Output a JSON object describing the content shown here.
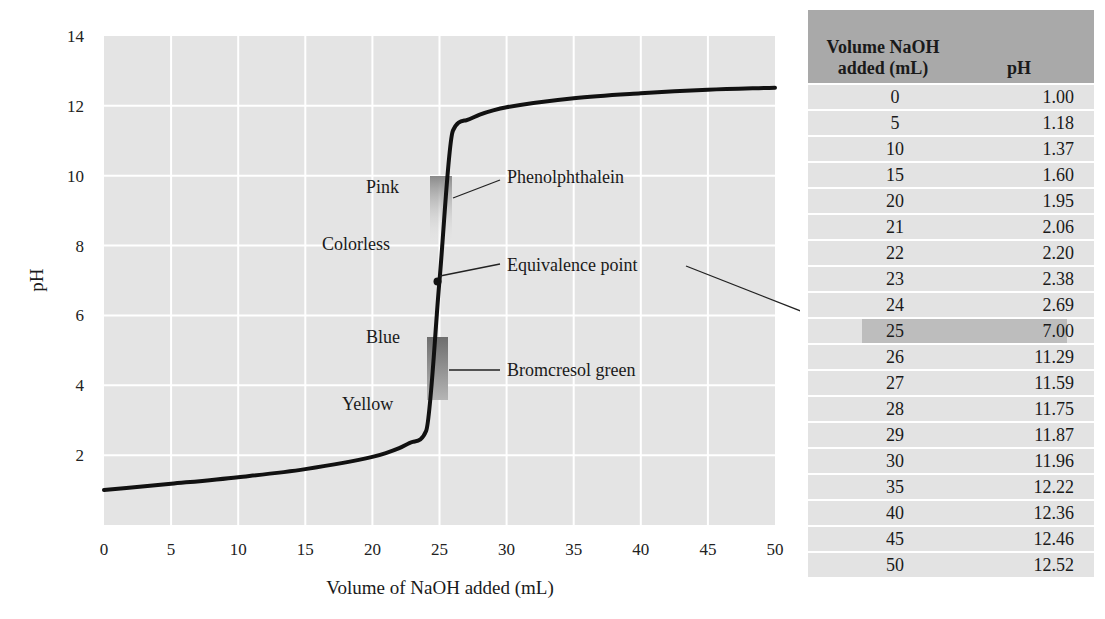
{
  "chart_data": {
    "type": "line",
    "title": "",
    "xlabel": "Volume of NaOH added (mL)",
    "ylabel": "pH",
    "xlim": [
      0,
      50
    ],
    "ylim": [
      0,
      14
    ],
    "grid": true,
    "x_ticks": [
      "0",
      "5",
      "10",
      "15",
      "20",
      "25",
      "30",
      "35",
      "40",
      "45",
      "50"
    ],
    "y_ticks": [
      "2",
      "4",
      "6",
      "8",
      "10",
      "12",
      "14"
    ],
    "series": [
      {
        "name": "Titration curve",
        "x": [
          0,
          5,
          10,
          15,
          20,
          21,
          22,
          23,
          24,
          25,
          26,
          27,
          28,
          29,
          30,
          35,
          40,
          45,
          50
        ],
        "y": [
          1.0,
          1.18,
          1.37,
          1.6,
          1.95,
          2.06,
          2.2,
          2.38,
          2.69,
          7.0,
          11.29,
          11.59,
          11.75,
          11.87,
          11.96,
          12.22,
          12.36,
          12.46,
          12.52
        ]
      }
    ],
    "annotations": [
      {
        "label": "Phenolphthalein",
        "type": "indicator",
        "range_pH": [
          8,
          10
        ],
        "upper_color_label": "Pink",
        "lower_color_label": "Colorless"
      },
      {
        "label": "Equivalence point",
        "type": "point",
        "x": 25,
        "y": 7.0
      },
      {
        "label": "Bromcresol green",
        "type": "indicator",
        "range_pH": [
          3.8,
          5.4
        ],
        "upper_color_label": "Blue",
        "lower_color_label": "Yellow"
      }
    ]
  },
  "labels": {
    "pink": "Pink",
    "colorless": "Colorless",
    "blue": "Blue",
    "yellow": "Yellow",
    "phenolphthalein": "Phenolphthalein",
    "equivalence": "Equivalence point",
    "bromcresol": "Bromcresol green"
  },
  "table": {
    "headers": [
      "Volume NaOH added (mL)",
      "pH"
    ],
    "header_line1": "Volume NaOH",
    "header_line2": "added (mL)",
    "header_ph": "pH",
    "highlight_row": 9,
    "rows": [
      [
        "0",
        "1.00"
      ],
      [
        "5",
        "1.18"
      ],
      [
        "10",
        "1.37"
      ],
      [
        "15",
        "1.60"
      ],
      [
        "20",
        "1.95"
      ],
      [
        "21",
        "2.06"
      ],
      [
        "22",
        "2.20"
      ],
      [
        "23",
        "2.38"
      ],
      [
        "24",
        "2.69"
      ],
      [
        "25",
        "7.00"
      ],
      [
        "26",
        "11.29"
      ],
      [
        "27",
        "11.59"
      ],
      [
        "28",
        "11.75"
      ],
      [
        "29",
        "11.87"
      ],
      [
        "30",
        "11.96"
      ],
      [
        "35",
        "12.22"
      ],
      [
        "40",
        "12.36"
      ],
      [
        "45",
        "12.46"
      ],
      [
        "50",
        "12.52"
      ]
    ]
  },
  "colors": {
    "plot_bg": "#e4e4e4",
    "grid": "#ffffff",
    "curve": "#111111",
    "header_bg": "#a9a9a9",
    "row_bg": "#e3e3e3",
    "highlight_bg": "#bdbdbd"
  }
}
